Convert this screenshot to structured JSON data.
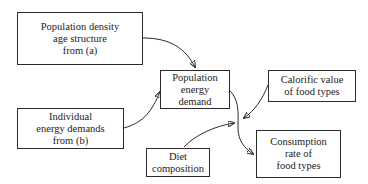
{
  "diagram": {
    "nodes": [
      {
        "id": "pop_density",
        "lines": [
          "Population density",
          "age structure",
          "from (a)"
        ]
      },
      {
        "id": "pop_energy",
        "lines": [
          "Population",
          "energy",
          "demand"
        ]
      },
      {
        "id": "calorific",
        "lines": [
          "Calorific value",
          "of food types"
        ]
      },
      {
        "id": "individual",
        "lines": [
          "Individual",
          "energy demands",
          "from (b)"
        ]
      },
      {
        "id": "diet",
        "lines": [
          "Diet",
          "composition"
        ]
      },
      {
        "id": "consumption",
        "lines": [
          "Consumption",
          "rate of",
          "food types"
        ]
      }
    ],
    "edges": [
      {
        "from": "pop_density",
        "to": "pop_energy"
      },
      {
        "from": "individual",
        "to": "pop_energy"
      },
      {
        "from": "pop_energy",
        "to": "consumption"
      },
      {
        "from": "calorific",
        "to": "consumption"
      },
      {
        "from": "diet",
        "to": "consumption"
      }
    ]
  }
}
